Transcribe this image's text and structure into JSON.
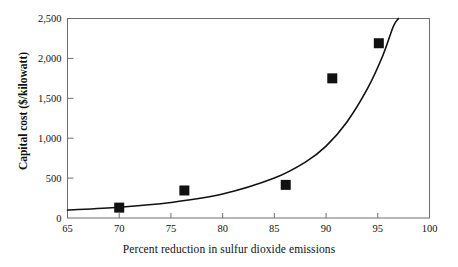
{
  "chart_data": {
    "type": "scatter",
    "title": "",
    "subtitle": "",
    "xlabel": "Percent reduction in sulfur dioxide emissions",
    "ylabel": "Capital cost ($/kilowatt)",
    "xlim": [
      65,
      100
    ],
    "ylim": [
      0,
      2500
    ],
    "xticks": [
      65,
      70,
      75,
      80,
      85,
      90,
      95,
      100
    ],
    "xticklabels": [
      "65",
      "70",
      "75",
      "80",
      "85",
      "90",
      "95",
      "100"
    ],
    "yticks": [
      0,
      500,
      1000,
      1500,
      2000,
      2500
    ],
    "yticklabels": [
      "0",
      "500",
      "1,000",
      "1,500",
      "2,000",
      "2,500"
    ],
    "grid": false,
    "legend": null,
    "series": [
      {
        "name": "Observed plants",
        "marker": "square",
        "color": "#111111",
        "points": [
          {
            "x": 70.0,
            "y": 130
          },
          {
            "x": 76.3,
            "y": 345
          },
          {
            "x": 86.1,
            "y": 415
          },
          {
            "x": 90.6,
            "y": 1750
          },
          {
            "x": 95.1,
            "y": 2190
          }
        ]
      },
      {
        "name": "Fitted exponential trend",
        "marker": "line",
        "color": "#111111",
        "points": [
          {
            "x": 65.0,
            "y": 100
          },
          {
            "x": 70.0,
            "y": 135
          },
          {
            "x": 75.0,
            "y": 195
          },
          {
            "x": 80.0,
            "y": 300
          },
          {
            "x": 85.0,
            "y": 500
          },
          {
            "x": 88.0,
            "y": 700
          },
          {
            "x": 90.0,
            "y": 900
          },
          {
            "x": 92.0,
            "y": 1200
          },
          {
            "x": 94.0,
            "y": 1620
          },
          {
            "x": 95.5,
            "y": 2040
          },
          {
            "x": 96.5,
            "y": 2400
          },
          {
            "x": 97.0,
            "y": 2500
          }
        ]
      }
    ]
  },
  "axes": {
    "x_title": "Percent reduction in sulfur dioxide emissions",
    "y_title": "Capital cost ($/kilowatt)"
  },
  "colors": {
    "frame": "#6e6e6e",
    "ink": "#111111",
    "background": "#ffffff"
  }
}
